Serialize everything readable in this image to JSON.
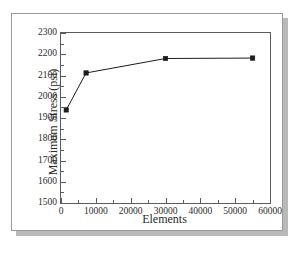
{
  "figure": {
    "caption_fragment": "",
    "border_color": "#9a9a9a",
    "shadow_color": "#b9b9b9",
    "axis_color": "#5c5c5c",
    "series_color": "#1d1d1d"
  },
  "chart_data": {
    "type": "line",
    "title": "",
    "xlabel": "Elements",
    "ylabel": "Maximum Stress (psi)",
    "xlim": [
      0,
      60000
    ],
    "ylim": [
      1500,
      2300
    ],
    "xticks": [
      0,
      10000,
      20000,
      30000,
      40000,
      50000,
      60000
    ],
    "xtick_labels": [
      "0",
      "10000",
      "20000",
      "30000",
      "40000",
      "50000",
      "60000"
    ],
    "yticks": [
      1500,
      1600,
      1700,
      1800,
      1900,
      2000,
      2100,
      2200,
      2300
    ],
    "ytick_labels": [
      "1500",
      "1600",
      "1700",
      "1800",
      "1900",
      "2000",
      "2100",
      "2200",
      "2300"
    ],
    "x_minor_interval": 5000,
    "y_minor_interval": 50,
    "grid": false,
    "legend": null,
    "marker": "square",
    "series": [
      {
        "name": "Maximum Stress",
        "x": [
          1500,
          7200,
          30000,
          55000
        ],
        "values": [
          1938,
          2112,
          2180,
          2182
        ]
      }
    ]
  }
}
